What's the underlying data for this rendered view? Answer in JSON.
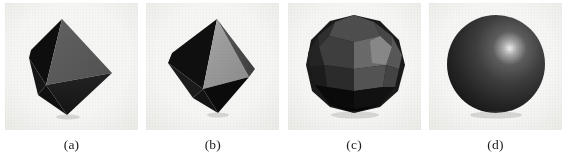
{
  "figure": {
    "kind": "figure-panels",
    "panel_background": "#f4f4f2",
    "page_background": "#ffffff",
    "caption_color": "#1b1b1b",
    "panels": [
      {
        "caption": "(a)",
        "shape_name": "octahedron-dark",
        "description": "Low-polygon octahedron approximation of a sphere, dark shading",
        "facets": [
          {
            "name": "front-right-large",
            "color": "#5a5a5a"
          },
          {
            "name": "left-upper",
            "color": "#0d0d0d"
          },
          {
            "name": "left-lower",
            "color": "#141414"
          },
          {
            "name": "bottom-front",
            "color": "#1a1a1a"
          },
          {
            "name": "bottom-right",
            "color": "#1f1f1f"
          }
        ]
      },
      {
        "caption": "(b)",
        "shape_name": "octahedron-light",
        "description": "Octahedron approximation with a brighter illuminated front facet",
        "facets": [
          {
            "name": "front-center-large",
            "color": "#9a9a9a"
          },
          {
            "name": "left-upper",
            "color": "#111111"
          },
          {
            "name": "left-lower",
            "color": "#1a1a1a"
          },
          {
            "name": "right-narrow",
            "color": "#4a4a4a"
          },
          {
            "name": "bottom-front",
            "color": "#0d0d0d"
          }
        ]
      },
      {
        "caption": "(c)",
        "shape_name": "faceted-polyhedron",
        "description": "Higher-resolution polygon mesh sphere with many visible flat facets",
        "facets": [
          {
            "name": "top-cap",
            "color": "#4b4b4b"
          },
          {
            "name": "upper-right-bright",
            "color": "#808080"
          },
          {
            "name": "upper-mid",
            "color": "#5f5f5f"
          },
          {
            "name": "left-shadow",
            "color": "#1d1d1d"
          },
          {
            "name": "lower-band",
            "color": "#2a2a2a"
          },
          {
            "name": "bottom-shadow",
            "color": "#0b0b0b"
          }
        ]
      },
      {
        "caption": "(d)",
        "shape_name": "smooth-sphere",
        "description": "Smooth-shaded sphere with specular highlight in the upper right",
        "facets": [
          {
            "name": "specular-highlight",
            "color": "#e8e8e8"
          },
          {
            "name": "body",
            "color": "#3a3a3a"
          },
          {
            "name": "terminator",
            "color": "#121212"
          }
        ]
      }
    ]
  }
}
